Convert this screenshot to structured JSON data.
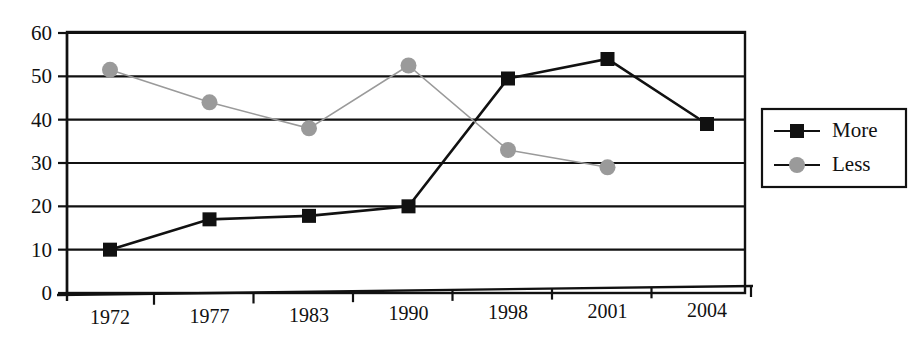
{
  "chart_data": {
    "type": "line",
    "title": "",
    "xlabel": "",
    "ylabel": "",
    "categories": [
      "1972",
      "1977",
      "1983",
      "1990",
      "1998",
      "2001",
      "2004"
    ],
    "ylim": [
      0,
      60
    ],
    "yticks": [
      0,
      10,
      20,
      30,
      40,
      50,
      60
    ],
    "grid": true,
    "legend_position": "right",
    "series": [
      {
        "name": "More",
        "marker": "square",
        "color": "#111111",
        "line_style": "solid",
        "values": [
          10,
          17,
          17.8,
          20,
          49.5,
          54,
          39
        ]
      },
      {
        "name": "Less",
        "marker": "circle",
        "color": "#9a9a9a",
        "line_style": "solid",
        "values": [
          51.5,
          44,
          38,
          52.5,
          33,
          29,
          null
        ]
      }
    ]
  },
  "axes": {
    "ytick_labels": [
      "60",
      "50",
      "40",
      "30",
      "20",
      "10",
      "0"
    ],
    "xtick_labels": [
      "1972",
      "1977",
      "1983",
      "1990",
      "1998",
      "2001",
      "2004"
    ]
  },
  "legend": {
    "entries": [
      {
        "label": "More",
        "marker": "square",
        "color": "#111111"
      },
      {
        "label": "Less",
        "marker": "circle",
        "color": "#9a9a9a"
      }
    ]
  },
  "colors": {
    "more": "#111111",
    "less": "#9a9a9a",
    "axis": "#111111",
    "background": "#ffffff"
  }
}
